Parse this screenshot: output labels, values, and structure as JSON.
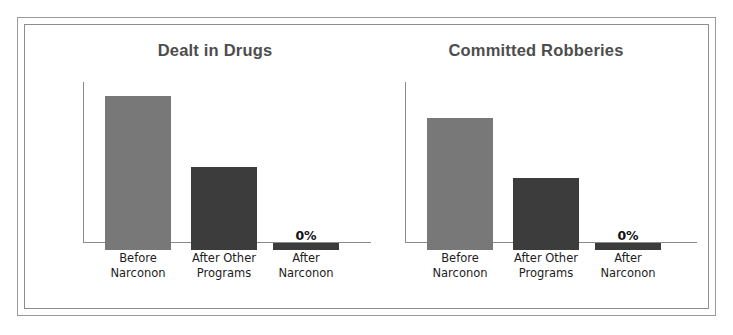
{
  "figure": {
    "frame_style": "double-rule-border",
    "background_color": "#ffffff",
    "border_color": "#9a9a9a"
  },
  "palette": {
    "bar_before": "#787878",
    "bar_after_other": "#3c3c3c",
    "bar_after_narconon": "#3c3c3c",
    "axis": "#8a8a8a",
    "title_text": "#4d4d4d",
    "value_text": "#111111",
    "category_text": "#1d1d1d"
  },
  "chart_data": [
    {
      "type": "bar",
      "title": "Dealt in Drugs",
      "xlabel": "",
      "ylabel": "",
      "ylim": [
        0,
        80
      ],
      "grid": false,
      "legend": "none",
      "categories": [
        "Before Narconon",
        "After Other Programs",
        "After Narconon"
      ],
      "category_lines": [
        [
          "Before",
          "Narconon"
        ],
        [
          "After Other",
          "Programs"
        ],
        [
          "After",
          "Narconon"
        ]
      ],
      "values": [
        73,
        37.9,
        0
      ],
      "value_labels": [
        "73%",
        "37.9%",
        "0%"
      ],
      "bar_colors": [
        "#787878",
        "#3c3c3c",
        "#3c3c3c"
      ]
    },
    {
      "type": "bar",
      "title": "Committed Robberies",
      "xlabel": "",
      "ylabel": "",
      "ylim": [
        0,
        80
      ],
      "grid": false,
      "legend": "none",
      "categories": [
        "Before Narconon",
        "After Other Programs",
        "After Narconon"
      ],
      "category_lines": [
        [
          "Before",
          "Narconon"
        ],
        [
          "After Other",
          "Programs"
        ],
        [
          "After",
          "Narconon"
        ]
      ],
      "values": [
        62.2,
        32.3,
        0
      ],
      "value_labels": [
        "62.2%",
        "32.3%",
        "0%"
      ],
      "bar_colors": [
        "#787878",
        "#3c3c3c",
        "#3c3c3c"
      ]
    }
  ]
}
